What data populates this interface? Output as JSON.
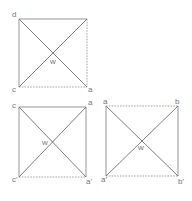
{
  "figure": {
    "colors": {
      "line": "#8a8a8a",
      "label": "#777777",
      "background": "#ffffff"
    },
    "squares": [
      {
        "id": "top",
        "labels": {
          "top_left": "d",
          "top_right": "",
          "bottom_left": "c",
          "bottom_right": "a",
          "center": "w"
        },
        "edges": {
          "top": "solid",
          "right": "dashed",
          "bottom": "dashed",
          "left": "solid"
        }
      },
      {
        "id": "bottom-left",
        "labels": {
          "top_left": "c",
          "top_right": "a",
          "bottom_left": "c'",
          "bottom_right": "a'",
          "center": "w"
        },
        "edges": {
          "top": "solid",
          "right": "solid",
          "bottom": "dashed",
          "left": "solid"
        }
      },
      {
        "id": "bottom-right",
        "labels": {
          "top_left": "a",
          "top_right": "b",
          "bottom_left": "a'",
          "bottom_right": "b'",
          "center": "w"
        },
        "edges": {
          "top": "dashed",
          "right": "solid",
          "bottom": "dashed",
          "left": "solid"
        }
      }
    ]
  }
}
